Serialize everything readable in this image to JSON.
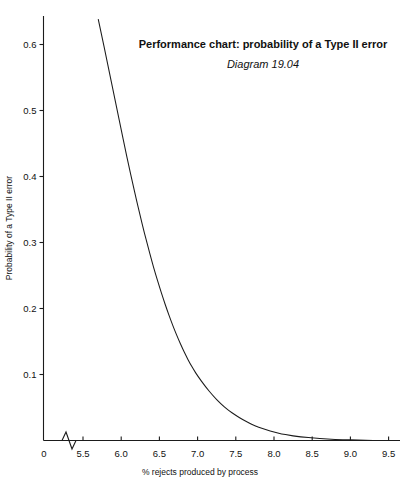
{
  "chart_data": {
    "type": "line",
    "title": "Performance chart: probability of a Type II error",
    "subtitle": "Diagram 19.04",
    "xlabel": "% rejects produced by process",
    "ylabel": "Probability of a Type II error",
    "xlim": [
      5.5,
      9.5
    ],
    "ylim": [
      0,
      0.64
    ],
    "grid": false,
    "legend": "none",
    "axis_break": true,
    "origin_tick_label": "0",
    "x_tick_labels": [
      "5.5",
      "6.0",
      "6.5",
      "7.0",
      "7.5",
      "8.0",
      "8.5",
      "9.0",
      "9.5"
    ],
    "x_ticks": [
      5.5,
      6.0,
      6.5,
      7.0,
      7.5,
      8.0,
      8.5,
      9.0,
      9.5
    ],
    "y_tick_labels": [
      "0",
      "0.1",
      "0.2",
      "0.3",
      "0.4",
      "0.5",
      "0.6"
    ],
    "y_ticks": [
      0,
      0.1,
      0.2,
      0.3,
      0.4,
      0.5,
      0.6
    ],
    "series": [
      {
        "name": "Probability of a Type II error",
        "x": [
          5.7,
          5.75,
          5.8,
          5.85,
          5.9,
          5.95,
          6.0,
          6.05,
          6.1,
          6.15,
          6.2,
          6.25,
          6.3,
          6.35,
          6.4,
          6.45,
          6.5,
          6.55,
          6.6,
          6.65,
          6.7,
          6.75,
          6.8,
          6.85,
          6.9,
          6.95,
          7.0,
          7.1,
          7.2,
          7.3,
          7.4,
          7.5,
          7.6,
          7.7,
          7.8,
          7.9,
          8.0,
          8.1,
          8.2,
          8.3,
          8.4,
          8.5,
          8.7,
          8.9,
          9.1,
          9.3,
          9.5
        ],
        "y": [
          0.638,
          0.611,
          0.583,
          0.555,
          0.527,
          0.499,
          0.471,
          0.443,
          0.416,
          0.39,
          0.364,
          0.34,
          0.316,
          0.294,
          0.272,
          0.252,
          0.233,
          0.215,
          0.198,
          0.182,
          0.167,
          0.153,
          0.14,
          0.128,
          0.117,
          0.107,
          0.098,
          0.082,
          0.068,
          0.056,
          0.046,
          0.038,
          0.031,
          0.025,
          0.02,
          0.016,
          0.013,
          0.01,
          0.008,
          0.006,
          0.005,
          0.004,
          0.002,
          0.001,
          0.001,
          0.0,
          0.0
        ]
      }
    ]
  }
}
